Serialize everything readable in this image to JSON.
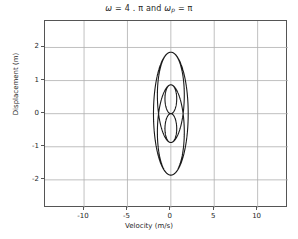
{
  "chart_data": {
    "type": "line",
    "title_parts": {
      "omega": "ω",
      "eq1": " = 4 . π and ",
      "omega_p_base": "ω",
      "omega_p_sub": "p",
      "eq2": " = π"
    },
    "xlabel": "Velocity (m/s)",
    "ylabel": "Displacement (m)",
    "xlim": [
      -14.5,
      13.5
    ],
    "ylim": [
      -2.85,
      2.8
    ],
    "xticks": [
      -10,
      -5,
      0,
      5,
      10
    ],
    "xticklabels": [
      "-10",
      "-5",
      "0",
      "5",
      "10"
    ],
    "yticks": [
      2,
      1,
      0,
      -1,
      -2
    ],
    "yticklabels": [
      "2",
      "1",
      "0",
      "-1",
      "-2"
    ],
    "grid": true,
    "grid_color": "#b0b0b0",
    "line_color": "#1a1a1a",
    "line_width": 1.1,
    "legend": null,
    "series": [
      {
        "name": "phase trajectory",
        "description": "Parametric phase-space trajectory of an amplitude-modulated oscillator: displacement y(t)=sin(w_p t)*sin(w t)/w_p scaled, velocity x(t)=dy/dt, with w = 4*pi and w_p = pi.",
        "parametric": {
          "omega": 12.566370614,
          "omega_p": 3.141592653,
          "t_start": 0,
          "t_end": 2.0,
          "samples": 4000,
          "x_expr": "A*(cos(wp*t)*sin(w*t)*wp + sin(wp*t)*cos(w*t)*w)/w",
          "y_expr": "A*sin(wp*t)*sin(w*t)",
          "amplitude": 2.0
        },
        "extremes": {
          "x_min": -13.3,
          "x_max": 12.1,
          "y_min": -2.55,
          "y_max": 2.55
        },
        "inner_loop_top_y": 1.5,
        "inner_loop_bottom_y": -1.5,
        "cusp_point": [
          0.2,
          0.0
        ]
      }
    ]
  },
  "axes": {
    "spine_color": "#555555",
    "tick_label_color": "#262626"
  }
}
